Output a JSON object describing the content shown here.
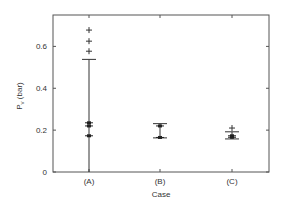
{
  "chart_data": {
    "type": "scatter",
    "title": "",
    "xlabel": "Case",
    "ylabel": "P_v (bar)",
    "ylabel_main": "P",
    "ylabel_sub": "v",
    "ylabel_unit": " (bar)",
    "categories": [
      "(A)",
      "(B)",
      "(C)"
    ],
    "ylim": [
      0,
      0.75
    ],
    "yticks": [
      0,
      0.2,
      0.4,
      0.6
    ],
    "ytick_labels": [
      "0",
      "0.2",
      "0.4",
      "0.6"
    ],
    "grid": false,
    "legend": null,
    "series": [
      {
        "name": "(A)",
        "whisker_low": 0.0,
        "whisker_high": 0.538,
        "points": [
          0.235,
          0.22,
          0.173
        ],
        "outliers": [
          0.678,
          0.625,
          0.577
        ]
      },
      {
        "name": "(B)",
        "whisker_low": 0.163,
        "whisker_high": 0.231,
        "points": [
          0.22,
          0.165
        ],
        "outliers": []
      },
      {
        "name": "(C)",
        "whisker_low": 0.158,
        "whisker_high": 0.192,
        "points": [
          0.173,
          0.166
        ],
        "outliers": [
          0.21
        ]
      }
    ]
  }
}
